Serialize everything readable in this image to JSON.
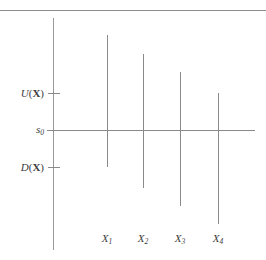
{
  "chart_data": {
    "type": "scatter",
    "title": "",
    "xlabel": "",
    "ylabel": "",
    "grid": false,
    "legend": null,
    "categories": [
      "X_1",
      "X_2",
      "X_3",
      "X_4"
    ],
    "reference_line": {
      "name": "s_0",
      "y": 130,
      "x_start": 47,
      "x_end": 255
    },
    "y_ticks": [
      {
        "label": "U(X)",
        "y": 93
      },
      {
        "label": "s_0",
        "y": 130
      },
      {
        "label": "D(X)",
        "y": 167
      }
    ],
    "y_axis": {
      "x": 53,
      "y_top": 18,
      "y_bottom": 250
    },
    "series": [
      {
        "name": "X_1",
        "x": 107,
        "top": 35,
        "bottom": 167
      },
      {
        "name": "X_2",
        "x": 143,
        "top": 54,
        "bottom": 188
      },
      {
        "name": "X_3",
        "x": 180,
        "top": 72,
        "bottom": 206
      },
      {
        "name": "X_4",
        "x": 218,
        "top": 93,
        "bottom": 224
      }
    ],
    "top_rule": {
      "y": 10,
      "x_start": 0,
      "x_end": 266
    }
  },
  "labels": {
    "y_axis": {
      "upper": {
        "fn": "U",
        "arg": "X"
      },
      "middle": {
        "base": "s",
        "sub": "0"
      },
      "lower": {
        "fn": "D",
        "arg": "X"
      }
    },
    "x_axis": [
      {
        "base": "X",
        "sub": "1"
      },
      {
        "base": "X",
        "sub": "2"
      },
      {
        "base": "X",
        "sub": "3"
      },
      {
        "base": "X",
        "sub": "4"
      }
    ]
  },
  "colors": {
    "background": "#ffffff",
    "stroke": "#8a8a8a",
    "axis": "#9a9a9a",
    "rule": "#8d8d8d",
    "text": "#3c3c3c"
  }
}
